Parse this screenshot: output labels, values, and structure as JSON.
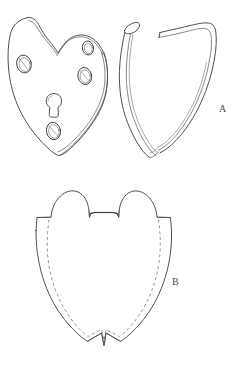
{
  "figure": {
    "background_color": "#ffffff",
    "ink_color": "#3a3a44",
    "width": 243,
    "height": 367,
    "labels": [
      {
        "id": "A",
        "text": "A",
        "x": 222,
        "y": 110,
        "describes": "escutcheon plate front view with side binding strip"
      },
      {
        "id": "B",
        "text": "B",
        "x": 175,
        "y": 283,
        "describes": "flattened development / pattern of the binding strip"
      }
    ],
    "objects": {
      "plate": {
        "name": "heart-shaped plate",
        "features": [
          {
            "name": "keyhole",
            "x": 54,
            "y": 102
          },
          {
            "name": "rivet-hole-left",
            "x": 24,
            "y": 64
          },
          {
            "name": "rivet-hole-upper-right",
            "x": 88,
            "y": 48
          },
          {
            "name": "rivet-hole-mid-right",
            "x": 85,
            "y": 76
          },
          {
            "name": "rivet-hole-bottom",
            "x": 53,
            "y": 131
          }
        ]
      },
      "strip": {
        "name": "curved binding strip",
        "view": "perspective side view"
      },
      "development": {
        "name": "flattened pattern",
        "view": "unrolled plan with dashed fold line"
      }
    }
  }
}
